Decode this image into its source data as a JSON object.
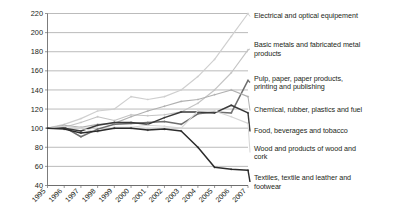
{
  "chart_data": {
    "type": "line",
    "title": "",
    "subtitle": "",
    "xlabel": "",
    "ylabel": "",
    "grid": "horizontal",
    "legend_position": "right-inline-labels",
    "index_base": "1995 = 100",
    "x": [
      "1995",
      "1996",
      "1997",
      "1998",
      "1999",
      "2000",
      "2001",
      "2002",
      "2003",
      "2004",
      "2005",
      "2006",
      "2007"
    ],
    "xlim": [
      1995,
      2007
    ],
    "ylim": [
      40,
      220
    ],
    "yticks": [
      40,
      60,
      80,
      100,
      120,
      140,
      160,
      180,
      200,
      220
    ],
    "series": [
      {
        "name": "Electrical and optical equipement",
        "color": "#cfcfcf",
        "values": [
          100,
          104,
          110,
          118,
          120,
          133,
          130,
          133,
          140,
          154,
          172,
          196,
          220
        ]
      },
      {
        "name": "Basic metals and fabricated metal products",
        "color": "#c4c4c4",
        "values": [
          100,
          101,
          106,
          112,
          108,
          114,
          113,
          114,
          117,
          126,
          140,
          158,
          182
        ]
      },
      {
        "name": "Pulp, paper, paper products, printing and publishing",
        "color": "#6e6e6e",
        "values": [
          100,
          101,
          91,
          99,
          104,
          105,
          106,
          107,
          104,
          115,
          117,
          116,
          150
        ]
      },
      {
        "name": "Chemical, rubber, plastics and fuel",
        "color": "#b0b0b0",
        "values": [
          100,
          103,
          101,
          104,
          105,
          112,
          118,
          123,
          128,
          130,
          135,
          140,
          133
        ]
      },
      {
        "name": "Food, beverages and tobacco",
        "color": "#3a3a3a",
        "values": [
          100,
          100,
          97,
          103,
          106,
          106,
          104,
          111,
          117,
          117,
          116,
          124,
          116
        ]
      },
      {
        "name": "Wood and products of wood and cork",
        "color": "#d6d6d6",
        "values": [
          100,
          102,
          100,
          96,
          101,
          101,
          103,
          102,
          100,
          118,
          118,
          112,
          105
        ]
      },
      {
        "name": "Textiles, textile and leather and footwear",
        "color": "#2b2b2b",
        "values": [
          100,
          99,
          95,
          97,
          100,
          100,
          98,
          99,
          97,
          80,
          59,
          57,
          56
        ]
      }
    ]
  },
  "legend": {
    "items": [
      {
        "label": "Electrical and optical equipement"
      },
      {
        "label": "Basic metals and fabricated metal\nproducts"
      },
      {
        "label": "Pulp, paper, paper products,\nprinting and publishing"
      },
      {
        "label": "Chemical, rubber, plastics and fuel"
      },
      {
        "label": "Food, beverages and tobacco"
      },
      {
        "label": "Wood and products of wood and\ncork"
      },
      {
        "label": "Textiles, textile and leather and\nfootwear"
      }
    ]
  }
}
